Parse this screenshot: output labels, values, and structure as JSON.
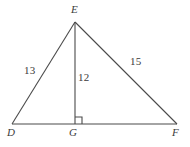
{
  "figure": {
    "type": "geometry-triangle-with-altitude",
    "background_color": "#ffffff",
    "stroke_color": "#4a4a4a",
    "text_color": "#3b3b3b",
    "vertices": {
      "E": {
        "label": "E",
        "x": 75,
        "y": 22
      },
      "D": {
        "label": "D",
        "x": 12,
        "y": 124
      },
      "G": {
        "label": "G",
        "x": 75,
        "y": 124
      },
      "F": {
        "label": "F",
        "x": 177,
        "y": 124
      }
    },
    "segments": {
      "DE": {
        "label": "13",
        "from": "D",
        "to": "E"
      },
      "EG": {
        "label": "12",
        "from": "E",
        "to": "G"
      },
      "EF": {
        "label": "15",
        "from": "E",
        "to": "F"
      },
      "DF": {
        "label": "",
        "from": "D",
        "to": "F"
      }
    },
    "right_angle": {
      "at": "G",
      "marker": "square",
      "size": 7
    }
  }
}
